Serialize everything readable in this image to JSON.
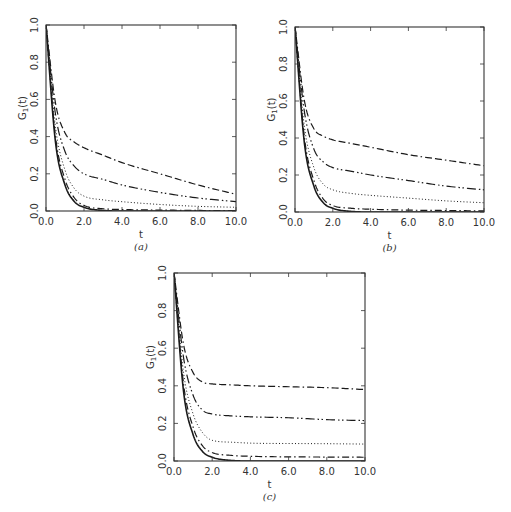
{
  "figure": {
    "ylabel": "G1(t)",
    "xlabel": "t"
  },
  "chart_data": [
    {
      "type": "line",
      "panel": "(a)",
      "title": "",
      "xlabel": "t",
      "ylabel": "G1(t)",
      "xlim": [
        0,
        10
      ],
      "ylim": [
        0,
        1
      ],
      "xticks": [
        "0.0",
        "2.0",
        "4.0",
        "6.0",
        "8.0",
        "10.0"
      ],
      "yticks": [
        "0.0",
        "0.2",
        "0.4",
        "0.6",
        "0.8",
        "1.0"
      ],
      "grid": false,
      "legend": null,
      "x": [
        0,
        0.5,
        1,
        1.5,
        2,
        3,
        4,
        6,
        8,
        10
      ],
      "series": [
        {
          "name": "solid",
          "style": "solid",
          "values": [
            1,
            0.37,
            0.14,
            0.05,
            0.02,
            0.003,
            0.0,
            0.0,
            0.0,
            0.0
          ]
        },
        {
          "name": "dash-dot",
          "style": "dashdot",
          "values": [
            1,
            0.4,
            0.17,
            0.07,
            0.03,
            0.012,
            0.008,
            0.005,
            0.003,
            0.002
          ]
        },
        {
          "name": "dotted",
          "style": "dotted",
          "values": [
            1,
            0.45,
            0.22,
            0.12,
            0.08,
            0.06,
            0.05,
            0.035,
            0.025,
            0.02
          ]
        },
        {
          "name": "long-dash-dot-dot",
          "style": "dashdotdot",
          "values": [
            1,
            0.52,
            0.32,
            0.24,
            0.2,
            0.17,
            0.14,
            0.1,
            0.07,
            0.05
          ]
        },
        {
          "name": "dash-dash-dot",
          "style": "dashdashdot",
          "values": [
            1,
            0.58,
            0.42,
            0.37,
            0.34,
            0.3,
            0.26,
            0.2,
            0.14,
            0.09
          ]
        }
      ]
    },
    {
      "type": "line",
      "panel": "(b)",
      "title": "",
      "xlabel": "t",
      "ylabel": "G1(t)",
      "xlim": [
        0,
        10
      ],
      "ylim": [
        0,
        1
      ],
      "xticks": [
        "0.0",
        "2.0",
        "4.0",
        "6.0",
        "8.0",
        "10.0"
      ],
      "yticks": [
        "0.0",
        "0.2",
        "0.4",
        "0.6",
        "0.8",
        "1.0"
      ],
      "grid": false,
      "legend": null,
      "x": [
        0,
        0.5,
        1,
        1.5,
        2,
        3,
        4,
        6,
        8,
        10
      ],
      "series": [
        {
          "name": "solid",
          "style": "solid",
          "values": [
            1,
            0.37,
            0.14,
            0.05,
            0.02,
            0.003,
            0.0,
            0.0,
            0.0,
            0.0
          ]
        },
        {
          "name": "dash-dot",
          "style": "dashdot",
          "values": [
            1,
            0.4,
            0.17,
            0.07,
            0.035,
            0.02,
            0.015,
            0.01,
            0.008,
            0.006
          ]
        },
        {
          "name": "dotted",
          "style": "dotted",
          "values": [
            1,
            0.46,
            0.24,
            0.15,
            0.12,
            0.1,
            0.09,
            0.075,
            0.06,
            0.05
          ]
        },
        {
          "name": "long-dash-dot-dot",
          "style": "dashdotdot",
          "values": [
            1,
            0.54,
            0.34,
            0.27,
            0.24,
            0.22,
            0.2,
            0.17,
            0.14,
            0.12
          ]
        },
        {
          "name": "dash-dash-dot",
          "style": "dashdashdot",
          "values": [
            1,
            0.6,
            0.45,
            0.41,
            0.39,
            0.37,
            0.35,
            0.31,
            0.28,
            0.25
          ]
        }
      ]
    },
    {
      "type": "line",
      "panel": "(c)",
      "title": "",
      "xlabel": "t",
      "ylabel": "G1(t)",
      "xlim": [
        0,
        10
      ],
      "ylim": [
        0,
        1
      ],
      "xticks": [
        "0.0",
        "2.0",
        "4.0",
        "6.0",
        "8.0",
        "10.0"
      ],
      "yticks": [
        "0.0",
        "0.2",
        "0.4",
        "0.6",
        "0.8",
        "1.0"
      ],
      "grid": false,
      "legend": null,
      "x": [
        0,
        0.5,
        1,
        1.5,
        2,
        3,
        4,
        6,
        8,
        10
      ],
      "series": [
        {
          "name": "solid",
          "style": "solid",
          "values": [
            1,
            0.37,
            0.14,
            0.05,
            0.02,
            0.003,
            0.0,
            0.0,
            0.0,
            0.0
          ]
        },
        {
          "name": "dash-dot",
          "style": "dashdot",
          "values": [
            1,
            0.41,
            0.18,
            0.08,
            0.045,
            0.03,
            0.025,
            0.022,
            0.021,
            0.02
          ]
        },
        {
          "name": "dotted",
          "style": "dotted",
          "values": [
            1,
            0.47,
            0.25,
            0.15,
            0.11,
            0.1,
            0.095,
            0.093,
            0.092,
            0.09
          ]
        },
        {
          "name": "long-dash-dot-dot",
          "style": "dashdotdot",
          "values": [
            1,
            0.55,
            0.35,
            0.27,
            0.25,
            0.24,
            0.235,
            0.23,
            0.22,
            0.215
          ]
        },
        {
          "name": "dash-dash-dot",
          "style": "dashdashdot",
          "values": [
            1,
            0.62,
            0.47,
            0.42,
            0.41,
            0.405,
            0.4,
            0.395,
            0.39,
            0.38
          ]
        }
      ]
    }
  ],
  "style": {
    "line_color": "#1a1a1a",
    "axis_color": "#333333",
    "background": "#ffffff"
  }
}
